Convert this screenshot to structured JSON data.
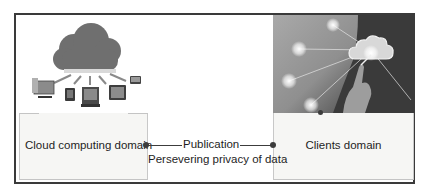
{
  "diagram": {
    "left_domain": {
      "label": "Cloud computing domain",
      "illustration": "cloud-with-devices-icon"
    },
    "right_domain": {
      "label": "Clients domain",
      "illustration": "hand-touching-cloud-network-photo"
    },
    "connector": {
      "label_top": "Publication",
      "label_bottom": "Persevering privacy of data"
    },
    "colors": {
      "frame": "#3a3a3a",
      "box_fill": "#f6f6f4",
      "cloud": "#6f6f6f",
      "line": "#3c3c3c"
    }
  }
}
